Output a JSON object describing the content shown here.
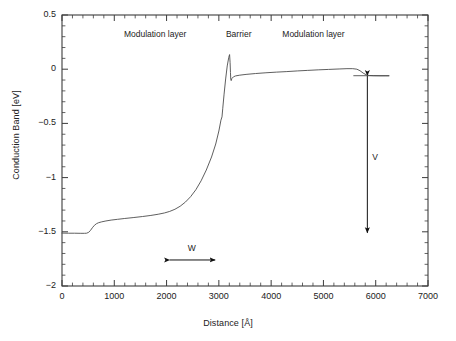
{
  "chart_data": {
    "type": "line",
    "title": "",
    "subtitle": "",
    "xlabel": "Distance [Å]",
    "ylabel": "Conduction Band [eV]",
    "xlim": [
      0,
      7000
    ],
    "ylim": [
      -2,
      0.5
    ],
    "xticks": [
      0,
      1000,
      2000,
      3000,
      4000,
      5000,
      6000,
      7000
    ],
    "xtick_labels": [
      "0",
      "1000",
      "2000",
      "3000",
      "4000",
      "5000",
      "6000",
      "7000"
    ],
    "yticks": [
      0.5,
      0,
      -0.5,
      -1,
      -1.5,
      -2
    ],
    "ytick_labels": [
      "0.5",
      "0",
      "−0.5",
      "−1",
      "−1.5",
      "−2"
    ],
    "x_minor_tick_step": 200,
    "y_minor_tick_step": 0.1,
    "grid": false,
    "legend": null,
    "legend_position": "none",
    "line_color": "#4d4d4d",
    "line_width": 0.9,
    "series": [
      {
        "name": "Conduction band edge",
        "points": [
          [
            0,
            -1.512
          ],
          [
            120,
            -1.513
          ],
          [
            240,
            -1.513
          ],
          [
            360,
            -1.514
          ],
          [
            430,
            -1.514
          ],
          [
            470,
            -1.513
          ],
          [
            510,
            -1.505
          ],
          [
            545,
            -1.487
          ],
          [
            580,
            -1.463
          ],
          [
            620,
            -1.44
          ],
          [
            660,
            -1.425
          ],
          [
            700,
            -1.416
          ],
          [
            760,
            -1.408
          ],
          [
            840,
            -1.4
          ],
          [
            940,
            -1.392
          ],
          [
            1060,
            -1.385
          ],
          [
            1200,
            -1.377
          ],
          [
            1360,
            -1.369
          ],
          [
            1540,
            -1.359
          ],
          [
            1700,
            -1.349
          ],
          [
            1840,
            -1.338
          ],
          [
            1960,
            -1.326
          ],
          [
            2060,
            -1.312
          ],
          [
            2160,
            -1.292
          ],
          [
            2260,
            -1.264
          ],
          [
            2360,
            -1.226
          ],
          [
            2460,
            -1.176
          ],
          [
            2560,
            -1.112
          ],
          [
            2660,
            -1.03
          ],
          [
            2760,
            -0.93
          ],
          [
            2860,
            -0.81
          ],
          [
            2940,
            -0.69
          ],
          [
            3000,
            -0.57
          ],
          [
            3040,
            -0.47
          ],
          [
            3060,
            -0.44
          ],
          [
            3075,
            -0.36
          ],
          [
            3100,
            -0.23
          ],
          [
            3130,
            -0.09
          ],
          [
            3160,
            0.03
          ],
          [
            3190,
            0.11
          ],
          [
            3205,
            0.135
          ],
          [
            3215,
            0.06
          ],
          [
            3222,
            -0.03
          ],
          [
            3228,
            -0.095
          ],
          [
            3236,
            -0.105
          ],
          [
            3250,
            -0.085
          ],
          [
            3280,
            -0.07
          ],
          [
            3320,
            -0.062
          ],
          [
            3400,
            -0.055
          ],
          [
            3520,
            -0.048
          ],
          [
            3700,
            -0.04
          ],
          [
            3900,
            -0.033
          ],
          [
            4100,
            -0.027
          ],
          [
            4300,
            -0.022
          ],
          [
            4500,
            -0.016
          ],
          [
            4700,
            -0.011
          ],
          [
            4900,
            -0.006
          ],
          [
            5100,
            -0.002
          ],
          [
            5300,
            0.002
          ],
          [
            5450,
            0.005
          ],
          [
            5560,
            0.005
          ],
          [
            5640,
            0.0
          ],
          [
            5700,
            -0.014
          ],
          [
            5760,
            -0.036
          ],
          [
            5820,
            -0.052
          ],
          [
            5880,
            -0.058
          ],
          [
            5960,
            -0.06
          ],
          [
            6080,
            -0.061
          ],
          [
            6180,
            -0.061
          ],
          [
            6250,
            -0.061
          ]
        ]
      }
    ],
    "annotations": [
      {
        "name": "modulation-layer-left",
        "text": "Modulation layer",
        "x": 1780,
        "y": 0.315
      },
      {
        "name": "barrier",
        "text": "Barrier",
        "x": 3380,
        "y": 0.315
      },
      {
        "name": "modulation-layer-right",
        "text": "Modulation layer",
        "x": 4810,
        "y": 0.315
      },
      {
        "name": "w-label",
        "text": "W",
        "x": 2480,
        "y": -1.66
      },
      {
        "name": "v-label",
        "text": "V",
        "x": 5990,
        "y": -0.82
      }
    ],
    "arrows": [
      {
        "name": "w-extent-arrow",
        "label": "W",
        "orientation": "horizontal",
        "x_start": 2060,
        "x_end": 2930,
        "y": -1.76,
        "double_headed": true
      },
      {
        "name": "v-potential-arrow",
        "label": "V",
        "orientation": "vertical",
        "x": 5840,
        "y_start": -0.06,
        "y_end": -1.51,
        "double_headed": true
      }
    ]
  }
}
